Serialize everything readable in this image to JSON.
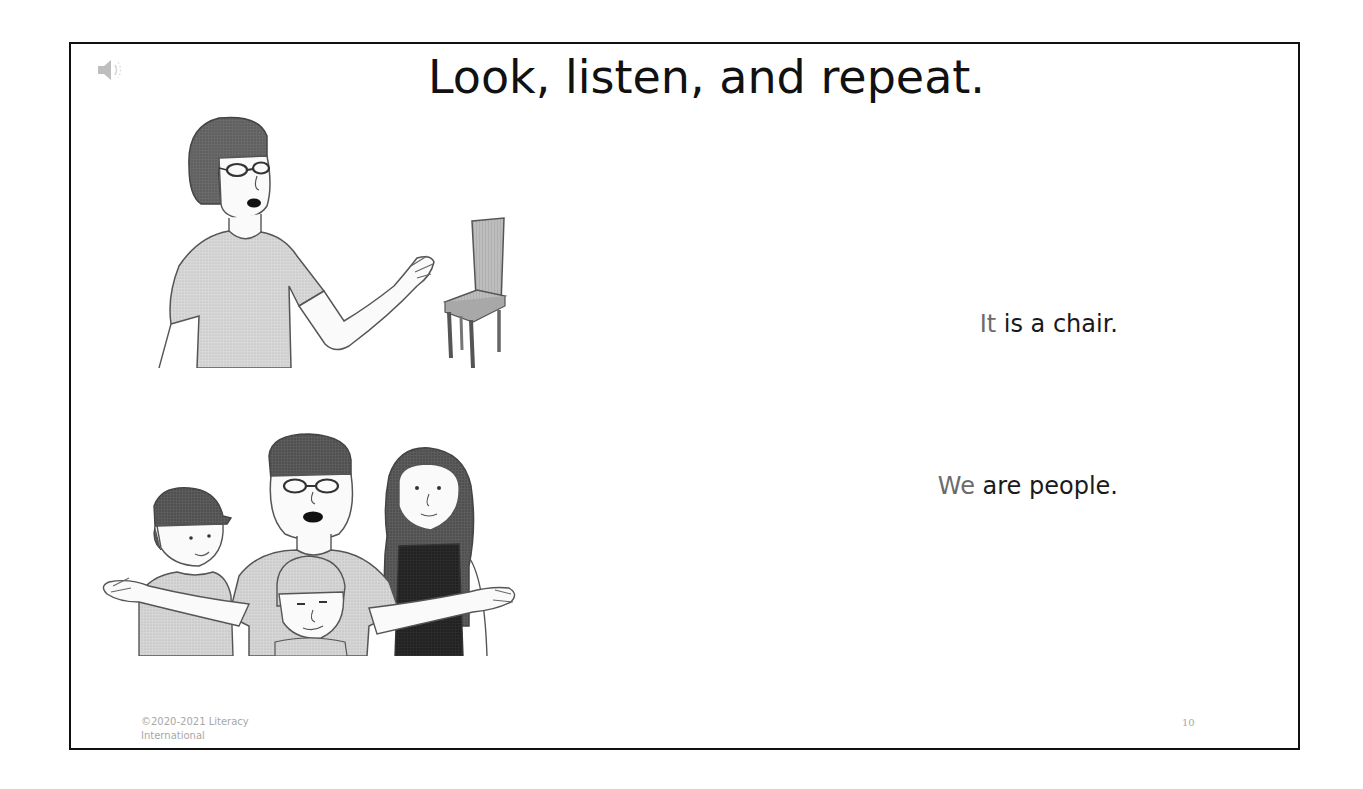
{
  "slide": {
    "title": "Look, listen, and repeat.",
    "audio_icon": "speaker-icon",
    "items": [
      {
        "illustration": "woman-pointing-at-chair",
        "sentence": {
          "pronoun": "It",
          "rest": " is a chair."
        }
      },
      {
        "illustration": "family-group-of-four",
        "sentence": {
          "pronoun": "We",
          "rest": " are people."
        }
      }
    ],
    "footer": {
      "copyright": "©2020-2021 Literacy International",
      "page_number": "10"
    },
    "colors": {
      "border": "#111111",
      "title": "#111111",
      "text": "#1a1a1a",
      "pronoun": "#6b6b6b",
      "footer": "#a8a8a8"
    }
  }
}
